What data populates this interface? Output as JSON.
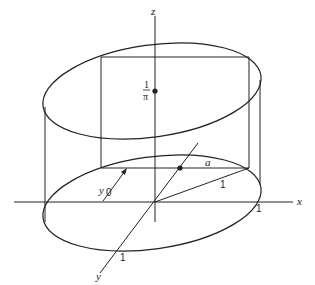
{
  "diagram": {
    "axes": {
      "x_label": "x",
      "y_label": "y",
      "z_label": "z"
    },
    "labels": {
      "height_numerator": "1",
      "height_denominator": "π",
      "y0_main": "y",
      "y0_sub": "0",
      "half_chord": "a",
      "radius": "1",
      "x_tick": "1",
      "y_tick": "1"
    },
    "colors": {
      "ink": "#222222",
      "background": "#ffffff"
    }
  }
}
